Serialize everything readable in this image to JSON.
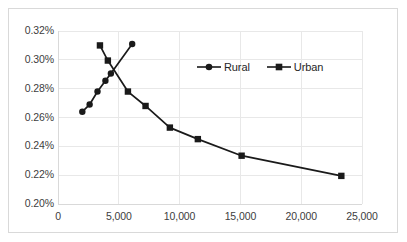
{
  "chart_data": {
    "type": "line",
    "title": "",
    "xlabel": "",
    "ylabel": "",
    "xlim": [
      0,
      25000
    ],
    "ylim": [
      0.002,
      0.0032
    ],
    "xticks": [
      0,
      5000,
      10000,
      15000,
      20000,
      25000
    ],
    "xticklabels": [
      "0",
      "5,000",
      "10,000",
      "15,000",
      "20,000",
      "25,000"
    ],
    "yticks": [
      0.002,
      0.0022,
      0.0024,
      0.0026,
      0.0028,
      0.003,
      0.0032
    ],
    "yticklabels": [
      "0.20%",
      "0.22%",
      "0.24%",
      "0.26%",
      "0.28%",
      "0.30%",
      "0.32%"
    ],
    "grid": true,
    "grid_axis": "both",
    "legend_position": "center-right",
    "series": [
      {
        "name": "Rural",
        "marker": "circle",
        "color": "#1a1a1a",
        "points": [
          {
            "x": 2000,
            "y": 0.00264,
            "label": "0.264%"
          },
          {
            "x": 2600,
            "y": 0.00269,
            "label": "0.269%"
          },
          {
            "x": 3250,
            "y": 0.00278,
            "label": "0.278%"
          },
          {
            "x": 3900,
            "y": 0.002855,
            "label": "0.286%"
          },
          {
            "x": 4350,
            "y": 0.002905,
            "label": "0.291%"
          },
          {
            "x": 6100,
            "y": 0.00311,
            "label": "0.311%"
          }
        ]
      },
      {
        "name": "Urban",
        "marker": "square",
        "color": "#1a1a1a",
        "points": [
          {
            "x": 3450,
            "y": 0.0031,
            "label": "0.310%"
          },
          {
            "x": 4100,
            "y": 0.002995,
            "label": "0.300%"
          },
          {
            "x": 5750,
            "y": 0.00278,
            "label": "0.278%"
          },
          {
            "x": 7200,
            "y": 0.00268,
            "label": "0.268%"
          },
          {
            "x": 9200,
            "y": 0.00253,
            "label": "0.253%"
          },
          {
            "x": 11500,
            "y": 0.00245,
            "label": "0.245%"
          },
          {
            "x": 15100,
            "y": 0.002335,
            "label": "0.234%"
          },
          {
            "x": 23300,
            "y": 0.002195,
            "label": "0.220%"
          }
        ]
      }
    ]
  },
  "legend": {
    "entries": [
      {
        "label": "Rural",
        "marker": "circle"
      },
      {
        "label": "Urban",
        "marker": "square"
      }
    ]
  },
  "colors": {
    "series": "#1a1a1a",
    "grid": "#e8e8e8",
    "axis": "#d9d9d9",
    "tick_text": "#404040",
    "frame": "#d9d9d9",
    "background": "#ffffff"
  }
}
